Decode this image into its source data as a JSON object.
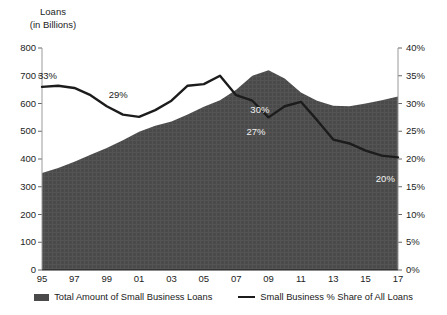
{
  "chart_data": {
    "type": "area",
    "title": "",
    "ylabel": "Loans\n(in Billions)",
    "ylabel_line1": "Loans",
    "ylabel_line2": "(in Billions)",
    "xlabel": "",
    "x": [
      1995,
      1996,
      1997,
      1998,
      1999,
      2000,
      2001,
      2002,
      2003,
      2004,
      2005,
      2006,
      2007,
      2008,
      2009,
      2010,
      2011,
      2012,
      2013,
      2014,
      2015,
      2016,
      2017
    ],
    "xtick_labels": [
      "95",
      "97",
      "99",
      "01",
      "03",
      "05",
      "07",
      "09",
      "11",
      "13",
      "15",
      "17"
    ],
    "xtick_years": [
      1995,
      1997,
      1999,
      2001,
      2003,
      2005,
      2007,
      2009,
      2011,
      2013,
      2015,
      2017
    ],
    "grid": false,
    "legend_position": "bottom",
    "left_axis": {
      "label": "Loans (in Billions)",
      "ylim": [
        0,
        800
      ],
      "ticks": [
        0,
        100,
        200,
        300,
        400,
        500,
        600,
        700,
        800
      ],
      "tick_labels": [
        "0",
        "100",
        "200",
        "300",
        "400",
        "500",
        "600",
        "700",
        "800"
      ]
    },
    "right_axis": {
      "label": "Percent share",
      "ylim": [
        0,
        40
      ],
      "ticks": [
        0,
        5,
        10,
        15,
        20,
        25,
        30,
        35,
        40
      ],
      "tick_labels": [
        "0%",
        "5%",
        "10%",
        "15%",
        "20%",
        "25%",
        "30%",
        "35%",
        "40%"
      ]
    },
    "series": [
      {
        "name": "Total Amount of Small Business Loans",
        "type": "area",
        "axis": "left",
        "color": "#4a4a4a",
        "values": [
          350,
          368,
          390,
          415,
          440,
          468,
          498,
          520,
          535,
          560,
          588,
          612,
          650,
          700,
          720,
          690,
          640,
          610,
          592,
          590,
          600,
          612,
          625
        ]
      },
      {
        "name": "Small Business % Share of All Loans",
        "type": "line",
        "axis": "right",
        "color": "#1c1c1c",
        "values": [
          33.0,
          33.2,
          32.8,
          31.5,
          29.5,
          28.0,
          27.6,
          28.8,
          30.5,
          33.2,
          33.5,
          35.0,
          31.5,
          30.5,
          27.5,
          29.5,
          30.3,
          27.0,
          23.5,
          22.8,
          21.5,
          20.6,
          20.3
        ]
      }
    ],
    "annotations": [
      {
        "text": "33%",
        "year": 1995,
        "value": 33.0,
        "style": "dark"
      },
      {
        "text": "29%",
        "year": 1999,
        "value": 29.5,
        "style": "dark"
      },
      {
        "text": "30%",
        "year": 2008,
        "value": 30.5,
        "style": "light"
      },
      {
        "text": "27%",
        "year": 2009,
        "value": 27.5,
        "style": "light"
      },
      {
        "text": "20%",
        "year": 2016,
        "value": 20.6,
        "style": "light"
      }
    ]
  },
  "legend": {
    "items": [
      {
        "label": "Total Amount of Small Business Loans",
        "marker": "area-swatch"
      },
      {
        "label": "Small Business % Share of All Loans",
        "marker": "line-swatch"
      }
    ]
  }
}
